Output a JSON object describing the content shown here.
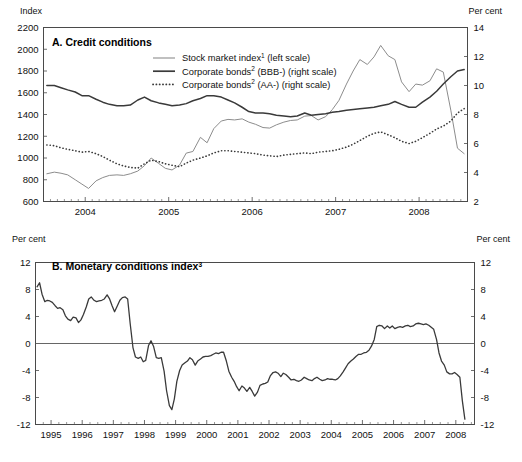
{
  "figure": {
    "panels": [
      "A. Credit conditions",
      "B. Monetary conditions index"
    ]
  },
  "panelA": {
    "title_prefix": "A. Credit conditions",
    "left_axis_title": "Index",
    "right_axis_title": "Per cent",
    "legend": [
      {
        "label_main": "Stock market index",
        "sup": "1",
        "label_tail": " (left scale)",
        "style": "thin-grey",
        "name": "stock-market-index"
      },
      {
        "label_main": "Corporate bonds",
        "sup": "2",
        "label_tail": " (BBB-) (right scale)",
        "style": "thick-solid",
        "name": "corporate-bonds-bbb"
      },
      {
        "label_main": "Corporate bonds",
        "sup": "2",
        "label_tail": " (AA-) (right scale)",
        "style": "dotted",
        "name": "corporate-bonds-aa"
      }
    ]
  },
  "panelB": {
    "title_prefix": "B. Monetary conditions index",
    "title_sup": "3",
    "left_axis_title": "Per cent",
    "right_axis_title": "Per cent"
  },
  "chart_data": [
    {
      "id": "panel-a",
      "type": "line",
      "title": "A. Credit conditions",
      "xlabel": "",
      "ylabel": "Index",
      "y2label": "Per cent",
      "grid": false,
      "legend_position": "top-center",
      "xlim": [
        2003.5,
        2008.58
      ],
      "xticklabels": [
        "2004",
        "2005",
        "2006",
        "2007",
        "2008"
      ],
      "xtickvalues": [
        2004,
        2005,
        2006,
        2007,
        2008
      ],
      "xminor_step": 0.0833333,
      "ylim": [
        600,
        2200
      ],
      "yticks": [
        600,
        800,
        1000,
        1200,
        1400,
        1600,
        1800,
        2000,
        2200
      ],
      "y2lim": [
        2,
        14
      ],
      "y2ticks": [
        2,
        4,
        6,
        8,
        10,
        12,
        14
      ],
      "series": [
        {
          "name": "Stock market index (left scale)",
          "axis": "left",
          "style": "thin-grey",
          "x": [
            2003.54,
            2003.63,
            2003.71,
            2003.79,
            2003.88,
            2003.96,
            2004.04,
            2004.13,
            2004.21,
            2004.29,
            2004.38,
            2004.46,
            2004.54,
            2004.63,
            2004.71,
            2004.79,
            2004.88,
            2004.96,
            2005.04,
            2005.13,
            2005.21,
            2005.29,
            2005.38,
            2005.46,
            2005.54,
            2005.63,
            2005.71,
            2005.79,
            2005.88,
            2005.96,
            2006.04,
            2006.13,
            2006.21,
            2006.29,
            2006.38,
            2006.46,
            2006.54,
            2006.63,
            2006.71,
            2006.79,
            2006.88,
            2006.96,
            2007.04,
            2007.13,
            2007.21,
            2007.29,
            2007.38,
            2007.46,
            2007.54,
            2007.63,
            2007.71,
            2007.79,
            2007.88,
            2007.96,
            2008.04,
            2008.13,
            2008.21,
            2008.29,
            2008.38,
            2008.46,
            2008.54
          ],
          "values": [
            855,
            870,
            860,
            845,
            800,
            760,
            720,
            790,
            820,
            840,
            845,
            840,
            855,
            880,
            930,
            1000,
            950,
            905,
            890,
            935,
            1045,
            1060,
            1190,
            1140,
            1270,
            1340,
            1355,
            1350,
            1360,
            1330,
            1310,
            1280,
            1275,
            1305,
            1330,
            1345,
            1350,
            1385,
            1390,
            1350,
            1380,
            1445,
            1530,
            1680,
            1800,
            1905,
            1860,
            1930,
            2035,
            1940,
            1905,
            1700,
            1610,
            1680,
            1670,
            1710,
            1820,
            1790,
            1440,
            1090,
            1040
          ]
        },
        {
          "name": "Corporate bonds (BBB-) (right scale)",
          "axis": "right",
          "style": "thick-solid",
          "x": [
            2003.54,
            2003.63,
            2003.71,
            2003.79,
            2003.88,
            2003.96,
            2004.04,
            2004.13,
            2004.21,
            2004.29,
            2004.38,
            2004.46,
            2004.54,
            2004.63,
            2004.71,
            2004.79,
            2004.88,
            2004.96,
            2005.04,
            2005.13,
            2005.21,
            2005.29,
            2005.38,
            2005.46,
            2005.54,
            2005.63,
            2005.71,
            2005.79,
            2005.88,
            2005.96,
            2006.04,
            2006.13,
            2006.21,
            2006.29,
            2006.38,
            2006.46,
            2006.54,
            2006.63,
            2006.71,
            2006.79,
            2006.88,
            2006.96,
            2007.04,
            2007.13,
            2007.21,
            2007.29,
            2007.38,
            2007.46,
            2007.54,
            2007.63,
            2007.71,
            2007.79,
            2007.88,
            2007.96,
            2008.04,
            2008.13,
            2008.21,
            2008.29,
            2008.38,
            2008.46,
            2008.54
          ],
          "values": [
            10.0,
            10.0,
            9.85,
            9.7,
            9.55,
            9.3,
            9.3,
            9.05,
            8.85,
            8.7,
            8.6,
            8.6,
            8.65,
            9.0,
            9.2,
            8.95,
            8.8,
            8.7,
            8.6,
            8.65,
            8.75,
            8.95,
            9.1,
            9.3,
            9.3,
            9.2,
            9.0,
            8.8,
            8.5,
            8.2,
            8.1,
            8.1,
            8.05,
            7.95,
            7.9,
            7.85,
            7.9,
            8.1,
            7.95,
            8.0,
            8.05,
            8.15,
            8.2,
            8.3,
            8.35,
            8.4,
            8.45,
            8.5,
            8.6,
            8.7,
            8.9,
            8.7,
            8.5,
            8.5,
            8.85,
            9.2,
            9.6,
            10.1,
            10.6,
            11.0,
            11.1
          ]
        },
        {
          "name": "Corporate bonds (AA-) (right scale)",
          "axis": "right",
          "style": "dotted",
          "x": [
            2003.54,
            2003.63,
            2003.71,
            2003.79,
            2003.88,
            2003.96,
            2004.04,
            2004.13,
            2004.21,
            2004.29,
            2004.38,
            2004.46,
            2004.54,
            2004.63,
            2004.71,
            2004.79,
            2004.88,
            2004.96,
            2005.04,
            2005.13,
            2005.21,
            2005.29,
            2005.38,
            2005.46,
            2005.54,
            2005.63,
            2005.71,
            2005.79,
            2005.88,
            2005.96,
            2006.04,
            2006.13,
            2006.21,
            2006.29,
            2006.38,
            2006.46,
            2006.54,
            2006.63,
            2006.71,
            2006.79,
            2006.88,
            2006.96,
            2007.04,
            2007.13,
            2007.21,
            2007.29,
            2007.38,
            2007.46,
            2007.54,
            2007.63,
            2007.71,
            2007.79,
            2007.88,
            2007.96,
            2008.04,
            2008.13,
            2008.21,
            2008.29,
            2008.38,
            2008.46,
            2008.54
          ],
          "values": [
            5.9,
            5.85,
            5.7,
            5.6,
            5.5,
            5.4,
            5.45,
            5.3,
            5.1,
            4.85,
            4.6,
            4.45,
            4.35,
            4.3,
            4.6,
            4.85,
            4.75,
            4.6,
            4.5,
            4.4,
            4.65,
            4.85,
            5.0,
            5.15,
            5.35,
            5.5,
            5.5,
            5.45,
            5.4,
            5.35,
            5.3,
            5.2,
            5.15,
            5.1,
            5.2,
            5.25,
            5.3,
            5.35,
            5.3,
            5.4,
            5.45,
            5.5,
            5.6,
            5.75,
            5.95,
            6.2,
            6.5,
            6.7,
            6.8,
            6.6,
            6.4,
            6.15,
            6.0,
            6.15,
            6.4,
            6.7,
            7.0,
            7.2,
            7.55,
            8.1,
            8.4
          ]
        }
      ]
    },
    {
      "id": "panel-b",
      "type": "line",
      "title": "B. Monetary conditions index",
      "xlabel": "",
      "ylabel": "Per cent",
      "y2label": "Per cent",
      "grid": false,
      "legend_position": "none",
      "xlim": [
        1994.5,
        2008.6
      ],
      "xticklabels": [
        "1995",
        "1996",
        "1997",
        "1998",
        "1999",
        "2000",
        "2001",
        "2002",
        "2003",
        "2004",
        "2005",
        "2006",
        "2007",
        "2008"
      ],
      "xtickvalues": [
        1995,
        1996,
        1997,
        1998,
        1999,
        2000,
        2001,
        2002,
        2003,
        2004,
        2005,
        2006,
        2007,
        2008
      ],
      "xminor_step": 0.25,
      "ylim": [
        -12,
        12
      ],
      "yticks": [
        -12,
        -8,
        -4,
        0,
        4,
        8,
        12
      ],
      "series": [
        {
          "name": "Monetary conditions index",
          "axis": "left",
          "style": "mci",
          "x": [
            1994.55,
            1994.63,
            1994.71,
            1994.8,
            1994.88,
            1994.96,
            1995.04,
            1995.13,
            1995.21,
            1995.29,
            1995.38,
            1995.46,
            1995.54,
            1995.63,
            1995.71,
            1995.8,
            1995.88,
            1995.96,
            1996.04,
            1996.13,
            1996.21,
            1996.29,
            1996.38,
            1996.46,
            1996.54,
            1996.63,
            1996.71,
            1996.8,
            1996.88,
            1996.96,
            1997.04,
            1997.13,
            1997.21,
            1997.29,
            1997.38,
            1997.46,
            1997.54,
            1997.63,
            1997.71,
            1997.8,
            1997.88,
            1997.96,
            1998.04,
            1998.13,
            1998.21,
            1998.29,
            1998.38,
            1998.46,
            1998.54,
            1998.63,
            1998.71,
            1998.8,
            1998.88,
            1998.96,
            1999.04,
            1999.13,
            1999.21,
            1999.29,
            1999.38,
            1999.46,
            1999.54,
            1999.63,
            1999.71,
            1999.8,
            1999.88,
            1999.96,
            2000.04,
            2000.13,
            2000.21,
            2000.29,
            2000.38,
            2000.46,
            2000.54,
            2000.63,
            2000.71,
            2000.8,
            2000.88,
            2000.96,
            2001.04,
            2001.13,
            2001.21,
            2001.29,
            2001.38,
            2001.46,
            2001.54,
            2001.63,
            2001.71,
            2001.8,
            2001.88,
            2001.96,
            2002.04,
            2002.13,
            2002.21,
            2002.29,
            2002.38,
            2002.46,
            2002.54,
            2002.63,
            2002.71,
            2002.8,
            2002.88,
            2002.96,
            2003.04,
            2003.13,
            2003.21,
            2003.29,
            2003.38,
            2003.46,
            2003.54,
            2003.63,
            2003.71,
            2003.8,
            2003.88,
            2003.96,
            2004.04,
            2004.13,
            2004.21,
            2004.29,
            2004.38,
            2004.46,
            2004.54,
            2004.63,
            2004.71,
            2004.8,
            2004.88,
            2004.96,
            2005.04,
            2005.13,
            2005.21,
            2005.29,
            2005.38,
            2005.46,
            2005.54,
            2005.63,
            2005.71,
            2005.8,
            2005.88,
            2005.96,
            2006.04,
            2006.13,
            2006.21,
            2006.29,
            2006.38,
            2006.46,
            2006.54,
            2006.63,
            2006.71,
            2006.8,
            2006.88,
            2006.96,
            2007.04,
            2007.13,
            2007.21,
            2007.29,
            2007.38,
            2007.46,
            2007.54,
            2007.63,
            2007.71,
            2007.8,
            2007.88,
            2007.96,
            2008.04,
            2008.13,
            2008.21,
            2008.29,
            2008.38,
            2008.46,
            2008.5,
            2008.54
          ],
          "values": [
            8.4,
            9.0,
            7.3,
            6.2,
            6.4,
            6.3,
            6.1,
            5.6,
            5.2,
            5.3,
            5.0,
            4.1,
            3.6,
            3.4,
            3.9,
            3.8,
            3.1,
            3.5,
            4.3,
            5.4,
            6.6,
            6.9,
            6.4,
            6.2,
            6.3,
            6.4,
            6.6,
            7.2,
            6.6,
            5.6,
            4.7,
            5.6,
            6.4,
            6.8,
            6.9,
            6.6,
            3.0,
            -0.6,
            -2.0,
            -2.2,
            -2.0,
            -2.7,
            -2.5,
            -0.3,
            0.4,
            -0.4,
            -2.1,
            -2.2,
            -2.1,
            -4.1,
            -7.0,
            -9.2,
            -9.8,
            -8.2,
            -5.6,
            -4.0,
            -3.2,
            -2.9,
            -2.6,
            -2.1,
            -2.4,
            -3.2,
            -2.6,
            -2.3,
            -2.0,
            -1.9,
            -1.9,
            -1.8,
            -1.6,
            -1.4,
            -1.5,
            -1.3,
            -1.3,
            -2.6,
            -4.1,
            -5.0,
            -5.6,
            -6.4,
            -7.0,
            -6.3,
            -6.6,
            -7.1,
            -6.5,
            -7.1,
            -7.8,
            -7.2,
            -6.2,
            -6.0,
            -5.9,
            -5.7,
            -4.8,
            -4.3,
            -4.2,
            -4.4,
            -4.9,
            -4.4,
            -4.6,
            -5.0,
            -5.4,
            -5.3,
            -5.5,
            -5.6,
            -5.4,
            -5.0,
            -5.2,
            -5.4,
            -5.5,
            -5.2,
            -5.0,
            -5.3,
            -5.5,
            -5.4,
            -5.2,
            -5.3,
            -5.3,
            -5.4,
            -5.2,
            -4.8,
            -4.2,
            -3.6,
            -3.0,
            -2.6,
            -2.3,
            -1.9,
            -1.6,
            -1.6,
            -1.4,
            -1.3,
            -1.0,
            -0.4,
            0.6,
            2.5,
            2.7,
            2.6,
            2.2,
            2.6,
            2.3,
            2.6,
            2.2,
            2.4,
            2.5,
            2.4,
            2.6,
            2.7,
            2.5,
            2.6,
            2.9,
            3.0,
            2.9,
            2.8,
            2.9,
            2.7,
            2.4,
            2.1,
            0.6,
            -1.4,
            -2.6,
            -3.2,
            -4.2,
            -4.5,
            -4.5,
            -4.3,
            -4.6,
            -5.0,
            -8.5,
            -11.2
          ]
        }
      ]
    }
  ]
}
